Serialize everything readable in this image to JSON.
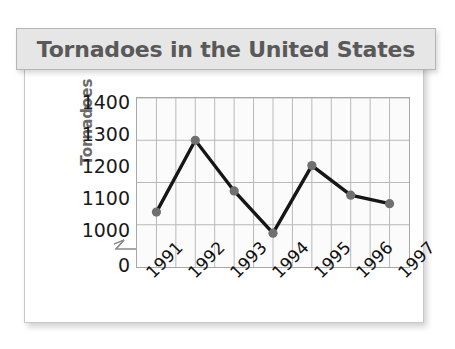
{
  "title": "Tornadoes in the United States",
  "axes": {
    "y_title": "Tornadoes",
    "y_ticks": [
      "1400",
      "1300",
      "1200",
      "1100",
      "1000",
      "0"
    ],
    "x_ticks": [
      "1991",
      "1992",
      "1993",
      "1994",
      "1995",
      "1996",
      "1997"
    ]
  },
  "colors": {
    "title_text": "#595959",
    "banner_bg": "#e6e6e6",
    "line": "#161616",
    "marker": "#707070",
    "grid": "#b9b9b9",
    "plot_bg": "#fbfbfb",
    "axis_label": "#111111",
    "y_title_text": "#6b6b6b"
  },
  "chart_data": {
    "type": "line",
    "title": "Tornadoes in the United States",
    "xlabel": "",
    "ylabel": "Tornadoes",
    "categories": [
      "1991",
      "1992",
      "1993",
      "1994",
      "1995",
      "1996",
      "1997"
    ],
    "values": [
      1130,
      1300,
      1180,
      1080,
      1240,
      1170,
      1150
    ],
    "ylim": [
      1000,
      1400
    ],
    "yticks": [
      1000,
      1100,
      1200,
      1300,
      1400
    ],
    "y_axis_break": true,
    "y_axis_break_label": "0",
    "grid": true,
    "legend": "none",
    "marker": "circle",
    "series": [
      {
        "name": "Tornadoes",
        "values": [
          1130,
          1300,
          1180,
          1080,
          1240,
          1170,
          1150
        ]
      }
    ]
  }
}
